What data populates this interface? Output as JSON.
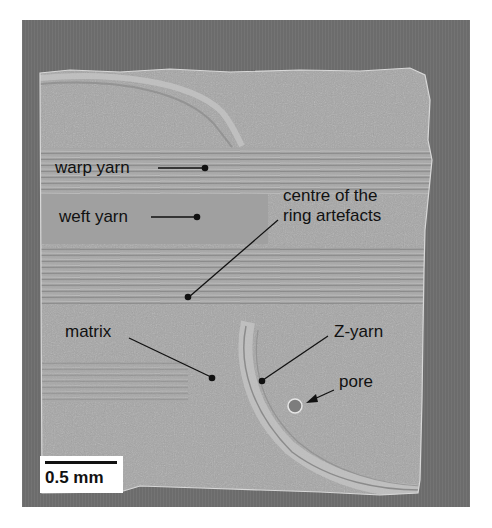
{
  "figure": {
    "type": "micro-CT cross-section of 3D woven composite",
    "colors": {
      "background": "#ffffff",
      "frame": "#6f6f6f",
      "specimen": "#a9a9a9",
      "label_text": "#111111"
    }
  },
  "annotations": [
    {
      "id": "warp-yarn",
      "text": "warp yarn"
    },
    {
      "id": "weft-yarn",
      "text": "weft yarn"
    },
    {
      "id": "ring-centre",
      "lines": [
        "centre of the",
        "ring artefacts"
      ]
    },
    {
      "id": "matrix",
      "text": "matrix"
    },
    {
      "id": "z-yarn",
      "text": "Z-yarn"
    },
    {
      "id": "pore",
      "text": "pore"
    }
  ],
  "scale_bar": {
    "label": "0.5 mm"
  }
}
